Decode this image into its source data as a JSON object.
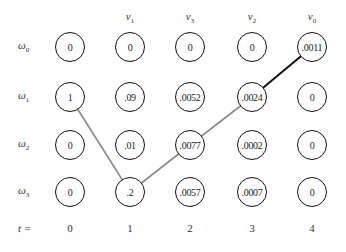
{
  "diagram": {
    "type": "viterbi-trellis",
    "time_label": "t =",
    "time_steps": [
      "0",
      "1",
      "2",
      "3",
      "4"
    ],
    "observations": [
      {
        "col": 1,
        "symbol": "v",
        "sub": "1"
      },
      {
        "col": 2,
        "symbol": "v",
        "sub": "3"
      },
      {
        "col": 3,
        "symbol": "v",
        "sub": "2"
      },
      {
        "col": 4,
        "symbol": "v",
        "sub": "0"
      }
    ],
    "states": [
      {
        "symbol": "ω",
        "sub": "0"
      },
      {
        "symbol": "ω",
        "sub": "1"
      },
      {
        "symbol": "ω",
        "sub": "2"
      },
      {
        "symbol": "ω",
        "sub": "3"
      }
    ],
    "values": [
      [
        "0",
        "0",
        "0",
        "0",
        ".0011"
      ],
      [
        "1",
        ".09",
        ".0052",
        ".0024",
        "0"
      ],
      [
        "0",
        ".01",
        ".0077",
        ".0002",
        "0"
      ],
      [
        "0",
        ".2",
        ".0057",
        ".0007",
        "0"
      ]
    ],
    "path": [
      {
        "from": [
          1,
          0
        ],
        "to": [
          3,
          1
        ],
        "color": "#8a8a8a"
      },
      {
        "from": [
          3,
          1
        ],
        "to": [
          2,
          2
        ],
        "color": "#8a8a8a"
      },
      {
        "from": [
          2,
          2
        ],
        "to": [
          1,
          3
        ],
        "color": "#8a8a8a"
      },
      {
        "from": [
          1,
          3
        ],
        "to": [
          0,
          4
        ],
        "color": "#111111"
      }
    ]
  }
}
